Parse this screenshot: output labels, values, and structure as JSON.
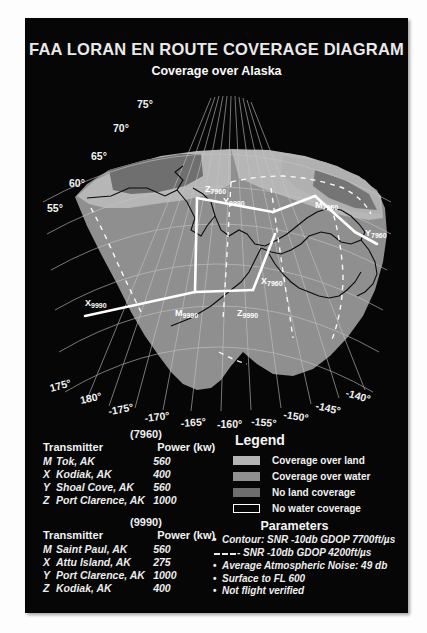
{
  "poster": {
    "title": "FAA LORAN EN ROUTE COVERAGE DIAGRAM",
    "subtitle": "Coverage over Alaska"
  },
  "map": {
    "latitude_labels": [
      "75°",
      "70°",
      "65°",
      "60°",
      "55°"
    ],
    "longitude_labels": [
      "175°",
      "180°",
      "-175°",
      "-170°",
      "-165°",
      "-160°",
      "-155°",
      "-150°",
      "-145°",
      "-140°"
    ],
    "station_labels": [
      {
        "code": "Z",
        "chain": "7960"
      },
      {
        "code": "Y",
        "chain": "9990"
      },
      {
        "code": "M",
        "chain": "7960"
      },
      {
        "code": "Y",
        "chain": "7960"
      },
      {
        "code": "X",
        "chain": "9990"
      },
      {
        "code": "M",
        "chain": "9990"
      },
      {
        "code": "Z",
        "chain": "9990"
      },
      {
        "code": "X",
        "chain": "7960"
      }
    ],
    "colors": {
      "coverage_land": "#b4b4b4",
      "coverage_water": "#909090",
      "no_land_coverage": "#6e6e6e",
      "no_water_coverage": "#060606",
      "grid": "#c8c8c8",
      "baseline": "#ffffff"
    }
  },
  "chains": [
    {
      "gri": "(7960)",
      "header_transmitter": "Transmitter",
      "header_power": "Power (kw)",
      "rows": [
        {
          "code": "M",
          "name": "Tok, AK",
          "power": "560"
        },
        {
          "code": "X",
          "name": "Kodiak, AK",
          "power": "400"
        },
        {
          "code": "Y",
          "name": "Shoal Cove, AK",
          "power": "560"
        },
        {
          "code": "Z",
          "name": "Port Clarence, AK",
          "power": "1000"
        }
      ]
    },
    {
      "gri": "(9990)",
      "header_transmitter": "Transmitter",
      "header_power": "Power (kw)",
      "rows": [
        {
          "code": "M",
          "name": "Saint Paul, AK",
          "power": "560"
        },
        {
          "code": "X",
          "name": "Attu Island, AK",
          "power": "275"
        },
        {
          "code": "Y",
          "name": "Port Clarence, AK",
          "power": "1000"
        },
        {
          "code": "Z",
          "name": "Kodiak, AK",
          "power": "400"
        }
      ]
    }
  ],
  "legend": {
    "title": "Legend",
    "items": [
      {
        "label": "Coverage over land",
        "color": "#b4b4b4",
        "border": "none"
      },
      {
        "label": "Coverage over water",
        "color": "#909090",
        "border": "none"
      },
      {
        "label": "No land coverage",
        "color": "#6e6e6e",
        "border": "none"
      },
      {
        "label": "No water coverage",
        "color": "#060606",
        "border": "#ffffff"
      }
    ]
  },
  "parameters": {
    "title": "Parameters",
    "items": [
      {
        "marker": "bullet",
        "text": "Contour: SNR -10db GDOP 7700ft/µs"
      },
      {
        "marker": "dash",
        "text": "- SNR -10db GDOP 4200ft/µs"
      },
      {
        "marker": "bullet",
        "text": "Average Atmospheric Noise: 49 db"
      },
      {
        "marker": "bullet",
        "text": "Surface to FL 600"
      },
      {
        "marker": "bullet",
        "text": "Not flight verified"
      }
    ]
  }
}
